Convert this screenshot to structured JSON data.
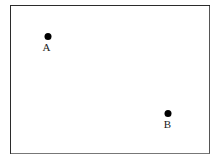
{
  "figure": {
    "width": 219,
    "height": 162,
    "background_color": "#ffffff",
    "frame": {
      "name": "rectangle-border",
      "stroke_color": "#2b2b2b",
      "fill_color": "#ffffff",
      "x": 10,
      "y": 5,
      "width": 200,
      "height": 149
    },
    "points": [
      {
        "id": "A",
        "label": "A",
        "marker": "filled-circle",
        "marker_color": "#000000",
        "marker_diameter": 7,
        "x": 47.5,
        "y": 36.5,
        "label_position": "below"
      },
      {
        "id": "B",
        "label": "B",
        "marker": "filled-circle",
        "marker_color": "#000000",
        "marker_diameter": 7,
        "x": 168,
        "y": 113,
        "label_position": "below"
      }
    ]
  }
}
